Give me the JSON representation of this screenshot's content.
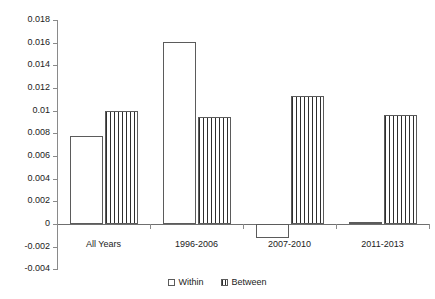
{
  "chart_data": {
    "type": "bar",
    "title": "",
    "subtitle": "",
    "xlabel": "",
    "ylabel": "",
    "categories": [
      "All Years",
      "1996-2006",
      "2007-2010",
      "2011-2013"
    ],
    "series": [
      {
        "name": "Within",
        "values": [
          0.0078,
          0.0161,
          -0.0012,
          0.0002
        ]
      },
      {
        "name": "Between",
        "values": [
          0.01,
          0.0094,
          0.0113,
          0.0096
        ]
      }
    ],
    "ylim": [
      -0.004,
      0.018
    ],
    "ytick_labels": [
      "0.018",
      "0.016",
      "0.014",
      "0.012",
      "0.01",
      "0.008",
      "0.006",
      "0.004",
      "0.002",
      "0",
      "-0.002",
      "-0.004"
    ],
    "ytick_values": [
      0.018,
      0.016,
      0.014,
      0.012,
      0.01,
      0.008,
      0.006,
      0.004,
      0.002,
      0,
      -0.002,
      -0.004
    ],
    "grid": false,
    "legend_position": "bottom",
    "legend": [
      "Within",
      "Between"
    ],
    "colors": {
      "within_fill": "#ffffff",
      "between_fill": "#ffffff",
      "between_pattern": "#2f2f2f",
      "bar_outline": "#5b5b5b",
      "axis": "#8a8a8a",
      "text": "#222222",
      "background": "#ffffff"
    }
  }
}
